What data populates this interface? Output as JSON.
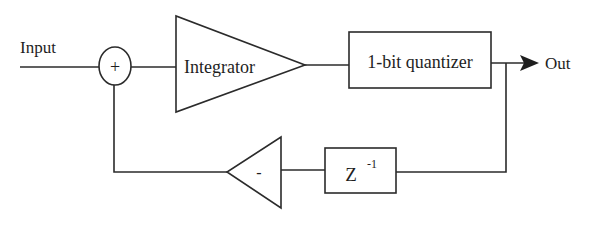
{
  "diagram": {
    "input_label": "Input",
    "output_label": "Out",
    "summer": {
      "symbol": "+"
    },
    "integrator": {
      "label": "Integrator"
    },
    "quantizer": {
      "label": "1-bit quantizer"
    },
    "delay": {
      "base": "Z",
      "exponent": "-1"
    },
    "inverter": {
      "symbol": "-"
    },
    "colors": {
      "stroke": "#2b2b2b",
      "text": "#1e1e1e",
      "background": "#ffffff"
    }
  }
}
